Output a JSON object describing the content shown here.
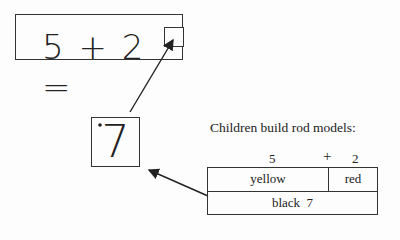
{
  "equation": {
    "text": "5 + 2 =",
    "operand_a": "5",
    "operator": "+",
    "operand_b": "2",
    "equals": "=",
    "answer_placeholder": "empty-box"
  },
  "answer": {
    "value": "7"
  },
  "caption": "Children build rod models:",
  "rod_model": {
    "top_labels": {
      "a": "5",
      "plus": "+",
      "b": "2"
    },
    "segments": [
      {
        "name": "yellow",
        "label": "yellow",
        "length": 5
      },
      {
        "name": "red",
        "label": "red",
        "length": 2
      }
    ],
    "total": {
      "label": "black  7",
      "color": "black",
      "length": 7
    }
  }
}
